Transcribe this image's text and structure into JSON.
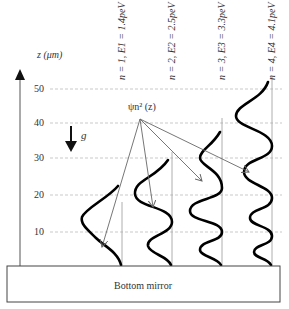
{
  "axis": {
    "label": "z (μm)",
    "ticks": [
      {
        "value": "50",
        "y": 89
      },
      {
        "value": "40",
        "y": 123
      },
      {
        "value": "30",
        "y": 158
      },
      {
        "value": "20",
        "y": 195
      },
      {
        "value": "10",
        "y": 232
      }
    ]
  },
  "gravity": {
    "label": "g"
  },
  "wavefunction_label": "ψn² (z)",
  "states": [
    {
      "label": "n = 1, E1 = 1.4peV",
      "n": "1",
      "E": "1.4peV",
      "x": 122
    },
    {
      "label": "n = 2, E2 = 2.5peV",
      "n": "2",
      "E": "2.5peV",
      "x": 172
    },
    {
      "label": "n = 3, E3 = 3.3peV",
      "n": "3",
      "E": "3.3peV",
      "x": 222
    },
    {
      "label": "n = 4, E4 = 4.1peV",
      "n": "4",
      "E": "4.1peV",
      "x": 272
    }
  ],
  "mirror": {
    "label": "Bottom mirror"
  },
  "colors": {
    "curve": "#000000",
    "grid": "#bbbbbb",
    "arrow": "#666666",
    "text": "#333333"
  }
}
